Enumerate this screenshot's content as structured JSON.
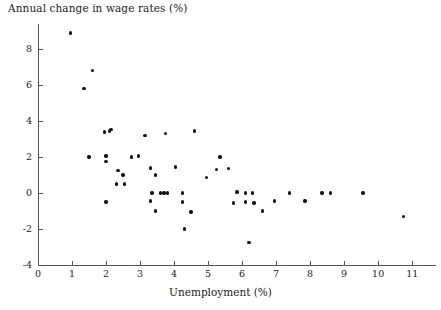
{
  "chart_data": {
    "type": "scatter",
    "title": "",
    "xlabel": "Unemployment (%)",
    "ylabel": "Annual change in wage rates (%)",
    "xlim": [
      0,
      11.7
    ],
    "ylim": [
      -4,
      9.4
    ],
    "xticks": [
      0,
      1,
      2,
      3,
      4,
      5,
      6,
      7,
      8,
      9,
      10,
      11
    ],
    "xtick_labels": [
      "0",
      "1",
      "2",
      "3",
      "4",
      "5",
      "6",
      "7",
      "8",
      "9",
      "10",
      "11"
    ],
    "yticks": [
      -4,
      -2,
      0,
      2,
      4,
      6,
      8
    ],
    "ytick_labels": [
      "-4",
      "-2",
      "0",
      "2",
      "4",
      "6",
      "8"
    ],
    "grid": false,
    "legend": null,
    "marker_color": "#111111",
    "axis_color": "#555555",
    "points": [
      {
        "x": 0.95,
        "y": 8.9
      },
      {
        "x": 1.6,
        "y": 6.8
      },
      {
        "x": 1.35,
        "y": 5.8
      },
      {
        "x": 1.95,
        "y": 3.4
      },
      {
        "x": 2.1,
        "y": 3.45
      },
      {
        "x": 2.15,
        "y": 3.55
      },
      {
        "x": 3.15,
        "y": 3.2
      },
      {
        "x": 3.75,
        "y": 3.3
      },
      {
        "x": 4.6,
        "y": 3.45
      },
      {
        "x": 1.5,
        "y": 2.0
      },
      {
        "x": 2.0,
        "y": 2.05
      },
      {
        "x": 2.0,
        "y": 1.75
      },
      {
        "x": 2.75,
        "y": 2.0
      },
      {
        "x": 2.95,
        "y": 2.05
      },
      {
        "x": 5.35,
        "y": 2.0
      },
      {
        "x": 2.35,
        "y": 1.25
      },
      {
        "x": 2.5,
        "y": 1.0
      },
      {
        "x": 3.3,
        "y": 1.4
      },
      {
        "x": 3.45,
        "y": 1.0
      },
      {
        "x": 4.05,
        "y": 1.45
      },
      {
        "x": 5.25,
        "y": 1.3
      },
      {
        "x": 5.6,
        "y": 1.35
      },
      {
        "x": 2.3,
        "y": 0.5
      },
      {
        "x": 2.55,
        "y": 0.5
      },
      {
        "x": 4.95,
        "y": 0.85
      },
      {
        "x": 3.35,
        "y": 0.0
      },
      {
        "x": 3.6,
        "y": 0.0
      },
      {
        "x": 3.7,
        "y": 0.0
      },
      {
        "x": 3.8,
        "y": 0.0
      },
      {
        "x": 4.25,
        "y": 0.0
      },
      {
        "x": 6.1,
        "y": 0.0
      },
      {
        "x": 6.3,
        "y": 0.0
      },
      {
        "x": 7.4,
        "y": 0.0
      },
      {
        "x": 8.35,
        "y": 0.0
      },
      {
        "x": 8.6,
        "y": 0.0
      },
      {
        "x": 9.55,
        "y": 0.0
      },
      {
        "x": 5.85,
        "y": 0.05
      },
      {
        "x": 6.95,
        "y": -0.45
      },
      {
        "x": 7.85,
        "y": -0.45
      },
      {
        "x": 2.0,
        "y": -0.5
      },
      {
        "x": 3.3,
        "y": -0.45
      },
      {
        "x": 4.25,
        "y": -0.5
      },
      {
        "x": 5.75,
        "y": -0.55
      },
      {
        "x": 6.1,
        "y": -0.5
      },
      {
        "x": 6.35,
        "y": -0.55
      },
      {
        "x": 3.45,
        "y": -1.0
      },
      {
        "x": 4.5,
        "y": -1.05
      },
      {
        "x": 6.6,
        "y": -1.0
      },
      {
        "x": 10.75,
        "y": -1.3
      },
      {
        "x": 4.3,
        "y": -2.0
      },
      {
        "x": 6.2,
        "y": -2.75
      }
    ]
  }
}
